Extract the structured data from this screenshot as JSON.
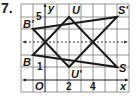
{
  "problem_number": "7.",
  "axes": {
    "x_label": "x",
    "y_label": "y",
    "origin_label": "O",
    "x_ticks": [
      "2",
      "4"
    ],
    "y_ticks": [
      "1",
      "5"
    ],
    "reflection_line": "y = 3 (dashed)"
  },
  "points": {
    "U": {
      "label": "U",
      "x": 2,
      "y": 5
    },
    "S_prime": {
      "label": "S'",
      "x": 6,
      "y": 5
    },
    "B_prime": {
      "label": "B'",
      "x": -1,
      "y": 4
    },
    "B": {
      "label": "B",
      "x": -1,
      "y": 2
    },
    "U_prime": {
      "label": "U'",
      "x": 2,
      "y": 1
    },
    "S": {
      "label": "S",
      "x": 6,
      "y": 1
    }
  },
  "triangles": [
    {
      "name": "BUS",
      "vertices": [
        "B",
        "U",
        "S"
      ]
    },
    {
      "name": "B'U'S'",
      "vertices": [
        "B'",
        "U'",
        "S'"
      ]
    }
  ],
  "colors": {
    "lines": "#1a1a1a",
    "grid": "#555555",
    "dashed": "#333333"
  }
}
